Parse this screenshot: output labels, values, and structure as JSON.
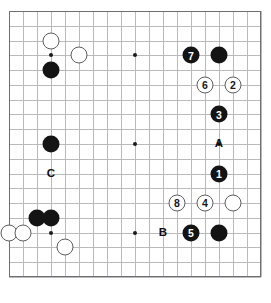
{
  "diagram": {
    "type": "go-board-diagram",
    "board_size": 19,
    "grid": {
      "left": 9,
      "top": 11,
      "step_x": 14.0,
      "step_y": 14.78
    },
    "colors": {
      "black": "#141414",
      "white": "#ffffff",
      "line": "#b9b9be",
      "border": "#6f6f73"
    },
    "star_points": [
      {
        "col": 3,
        "row": 3
      },
      {
        "col": 9,
        "row": 3
      },
      {
        "col": 15,
        "row": 3
      },
      {
        "col": 3,
        "row": 9
      },
      {
        "col": 9,
        "row": 9
      },
      {
        "col": 15,
        "row": 9
      },
      {
        "col": 3,
        "row": 15
      },
      {
        "col": 9,
        "row": 15
      },
      {
        "col": 15,
        "row": 15
      }
    ],
    "stones": [
      {
        "col": 3,
        "row": 2,
        "color": "white",
        "label": ""
      },
      {
        "col": 5,
        "row": 3,
        "color": "white",
        "label": ""
      },
      {
        "col": 3,
        "row": 4,
        "color": "black",
        "label": ""
      },
      {
        "col": 3,
        "row": 9,
        "color": "black",
        "label": ""
      },
      {
        "col": 2,
        "row": 14,
        "color": "black",
        "label": ""
      },
      {
        "col": 3,
        "row": 14,
        "color": "black",
        "label": ""
      },
      {
        "col": 0,
        "row": 15,
        "color": "white",
        "label": ""
      },
      {
        "col": 1,
        "row": 15,
        "color": "white",
        "label": ""
      },
      {
        "col": 4,
        "row": 16,
        "color": "white",
        "label": ""
      },
      {
        "col": 13,
        "row": 3,
        "color": "black",
        "label": "7"
      },
      {
        "col": 15,
        "row": 3,
        "color": "black",
        "label": ""
      },
      {
        "col": 14,
        "row": 5,
        "color": "white",
        "label": "6"
      },
      {
        "col": 16,
        "row": 5,
        "color": "white",
        "label": "2"
      },
      {
        "col": 15,
        "row": 7,
        "color": "black",
        "label": "3"
      },
      {
        "col": 15,
        "row": 11,
        "color": "black",
        "label": "1"
      },
      {
        "col": 12,
        "row": 13,
        "color": "white",
        "label": "8"
      },
      {
        "col": 14,
        "row": 13,
        "color": "white",
        "label": "4"
      },
      {
        "col": 16,
        "row": 13,
        "color": "white",
        "label": ""
      },
      {
        "col": 13,
        "row": 15,
        "color": "black",
        "label": "5"
      },
      {
        "col": 15,
        "row": 15,
        "color": "black",
        "label": ""
      }
    ],
    "point_labels": [
      {
        "col": 15,
        "row": 9,
        "text": "A"
      },
      {
        "col": 11,
        "row": 15,
        "text": "B"
      },
      {
        "col": 3,
        "row": 11,
        "text": "C"
      }
    ]
  }
}
